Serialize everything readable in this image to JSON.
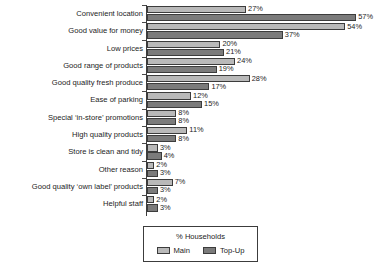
{
  "chart_data": {
    "type": "bar",
    "orientation": "horizontal",
    "title": "",
    "xlabel": "",
    "ylabel": "",
    "legend_title": "% Households",
    "legend_position": "bottom-center",
    "grid": false,
    "xlim": [
      0,
      60
    ],
    "value_suffix": "%",
    "categories": [
      "Convenient location",
      "Good value for money",
      "Low prices",
      "Good range of products",
      "Good quality fresh produce",
      "Ease of parking",
      "Special ‘in-store’ promotions",
      "High quality products",
      "Store is clean and tidy",
      "Other reason",
      "Good quality ‘own label’ products",
      "Helpful staff"
    ],
    "series": [
      {
        "name": "Main",
        "color": "#b9b9b9",
        "values": [
          27,
          54,
          20,
          24,
          28,
          12,
          8,
          11,
          3,
          2,
          7,
          2
        ],
        "labels": [
          "27%",
          "54%",
          "20%",
          "24%",
          "28%",
          "12%",
          "8%",
          "11%",
          "3%",
          "2%",
          "7%",
          "2%"
        ]
      },
      {
        "name": "Top-Up",
        "color": "#7b7b7b",
        "values": [
          57,
          37,
          21,
          19,
          17,
          15,
          8,
          8,
          4,
          3,
          3,
          3
        ],
        "labels": [
          "57%",
          "37%",
          "21%",
          "19%",
          "17%",
          "15%",
          "8%",
          "8%",
          "4%",
          "3%",
          "3%",
          "3%"
        ]
      }
    ]
  }
}
